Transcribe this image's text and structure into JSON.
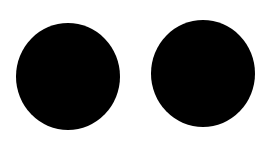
{
  "canvas": {
    "width": 270,
    "height": 147,
    "background": "#ffffff"
  },
  "shapes": [
    {
      "type": "circle",
      "label": "left-dot",
      "fill": "#000000",
      "center": [
        68,
        76
      ],
      "diameter": 105
    },
    {
      "type": "circle",
      "label": "right-dot",
      "fill": "#000000",
      "center": [
        203,
        74
      ],
      "diameter": 105
    }
  ]
}
